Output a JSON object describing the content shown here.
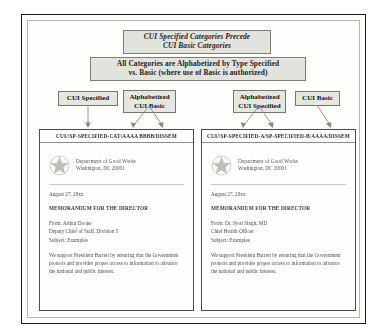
{
  "slide": {
    "callouts": [
      {
        "id": "precede",
        "line1": "CUI Specified Categories Precede",
        "line2": "CUI Basic Categories"
      },
      {
        "id": "alphabetized",
        "line1": "All Categories are Alphabetized by Type Specified",
        "line2": "vs. Basic (where use of Basic is authorized)"
      }
    ],
    "tags": [
      {
        "id": "cui-specified-left",
        "line1": "CUI Specified",
        "line2": ""
      },
      {
        "id": "alphabetized-cui-basic",
        "line1": "Alphabetized",
        "line2": "CUI Basic"
      },
      {
        "id": "alphabetized-cui-specified",
        "line1": "Alphabetized",
        "line2": "CUI Specified"
      },
      {
        "id": "cui-basic-right",
        "line1": "CUI Basic",
        "line2": ""
      }
    ],
    "documents": [
      {
        "id": "doc-left",
        "banner": "CUI//SP-SPECIFIED-CAT/AAAA BBBB/DISSEM",
        "agency_line1": "Department of Good Works",
        "agency_line2": "Washington, DC  20001",
        "seal_icon": "star-seal-icon",
        "date": "August 27, 20xx",
        "memo_line": "MEMORANDUM FOR THE DIRECTOR",
        "fields": [
          "From:  Arthur Doone",
          "Deputy Chief of Staff, Division 5",
          "Subject:  Examples"
        ],
        "paragraph": "We support President Barrett by ensuring that the Government protects and provides proper access to information to advance the national and public interest."
      },
      {
        "id": "doc-right",
        "banner": "CUI//SP-SPECIFIED-A/SP-SPECIFIED-B/AAAA/DISSEM",
        "agency_line1": "Department of Good Works",
        "agency_line2": "Washington, DC  20001",
        "seal_icon": "star-seal-icon",
        "date": "August 27, 20xx",
        "memo_line": "MEMORANDUM FOR THE DIRECTOR",
        "fields": [
          "From:  Dr. Jyoti Singh, MD",
          "Chief Health Officer",
          "Subject:  Examples"
        ],
        "paragraph": "We support President Barrett by ensuring that the Government protects and provides proper access to information to advance the national and public interest."
      }
    ],
    "colors": {
      "callout_fill": "#e3e3dd",
      "tag_fill": "#e6e6e0",
      "border": "#1a1a1a",
      "connector": "#8a8a84"
    }
  }
}
